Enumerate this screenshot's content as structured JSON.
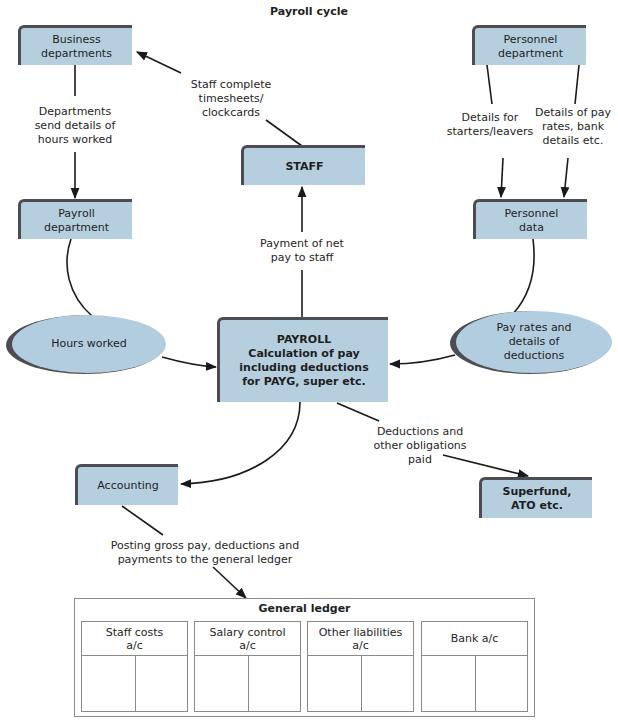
{
  "title": "Payroll cycle",
  "colors": {
    "box_fill": "#b6cfdf",
    "box_border": "#4c4c52",
    "line": "#1a1a1a"
  },
  "nodes": {
    "business_departments": "Business\ndepartments",
    "payroll_department": "Payroll\ndepartment",
    "staff": "STAFF",
    "personnel_department": "Personnel\ndepartment",
    "personnel_data": "Personnel\ndata",
    "payroll": "PAYROLL\nCalculation of pay\nincluding deductions\nfor PAYG, super etc.",
    "hours_worked": "Hours worked",
    "pay_rates": "Pay rates and\ndetails of\ndeductions",
    "accounting": "Accounting",
    "superfund": "Superfund,\nATO etc."
  },
  "flows": {
    "staff_timesheets": "Staff complete\ntimesheets/\nclockcards",
    "departments_send": "Departments\nsend details of\nhours worked",
    "payment_net_pay": "Payment of net\npay to staff",
    "starters_leavers": "Details for\nstarters/leavers",
    "pay_rates_bank": "Details of pay\nrates, bank\ndetails etc.",
    "deductions_paid": "Deductions and\nother obligations\npaid",
    "posting": "Posting gross pay, deductions and\npayments to the general ledger"
  },
  "ledger": {
    "title": "General ledger",
    "accounts": [
      {
        "name": "Staff costs\na/c"
      },
      {
        "name": "Salary control\na/c"
      },
      {
        "name": "Other liabilities\na/c"
      },
      {
        "name": "Bank a/c"
      }
    ]
  }
}
